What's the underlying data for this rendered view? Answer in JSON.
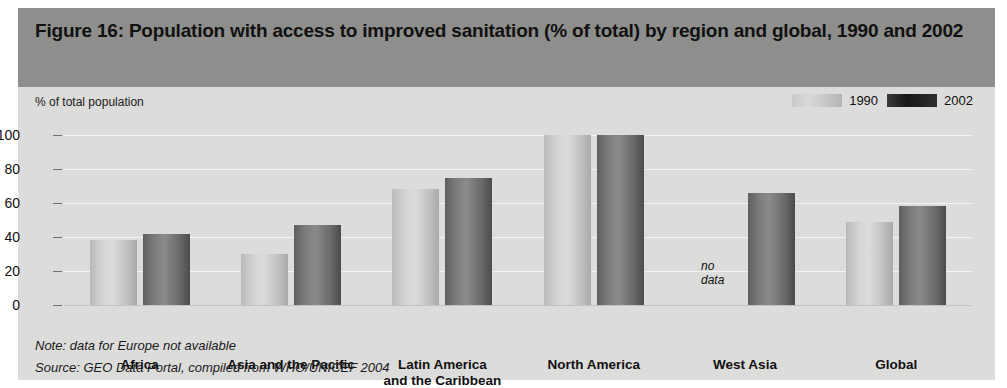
{
  "figure": {
    "title": "Figure 16: Population with access to improved sanitation  (% of total) by region and global, 1990 and 2002",
    "axis_title": "% of total population",
    "note": "Note: data for Europe not available",
    "source": "Source:  GEO Data Portal, compiled from WHO/UNICEF 2004",
    "nodata_line1": "no",
    "nodata_line2": "data"
  },
  "legend": {
    "position": "top-right",
    "entries": [
      {
        "label": "1990",
        "color": "#cfcfcd",
        "swatch": "swatch-1990"
      },
      {
        "label": "2002",
        "color": "#1e1e1e",
        "swatch": "swatch-2002"
      }
    ]
  },
  "chart_data": {
    "type": "bar",
    "title": "Figure 16: Population with access to improved sanitation  (% of total) by region and global, 1990 and 2002",
    "xlabel": "",
    "ylabel": "% of total population",
    "ylim": [
      0,
      100
    ],
    "yticks": [
      0,
      20,
      40,
      60,
      80,
      100
    ],
    "ytick_labels": [
      "0",
      "20",
      "40",
      "60",
      "80",
      "100"
    ],
    "grid": true,
    "legend_position": "top-right",
    "categories": [
      "Africa",
      "Asia and the Pacific",
      "Latin America and the Caribbean",
      "North America",
      "West Asia",
      "Global"
    ],
    "category_display": [
      [
        "Africa"
      ],
      [
        "Asia and the Pacific"
      ],
      [
        "Latin America",
        "and the Caribbean"
      ],
      [
        "North America"
      ],
      [
        "West Asia"
      ],
      [
        "Global"
      ]
    ],
    "series": [
      {
        "name": "1990",
        "values": [
          38,
          30,
          68,
          100,
          null,
          49
        ]
      },
      {
        "name": "2002",
        "values": [
          42,
          47,
          75,
          100,
          66,
          58
        ]
      }
    ],
    "annotations": [
      {
        "text": "no data",
        "category": "West Asia",
        "series": "1990"
      }
    ]
  }
}
